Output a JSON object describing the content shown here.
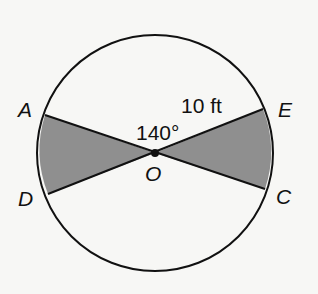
{
  "diagram": {
    "center_label": "O",
    "angle_label": "140°",
    "radius_label": "10 ft",
    "points": {
      "A": "A",
      "E": "E",
      "D": "D",
      "C": "C"
    },
    "colors": {
      "background": "#f7f7f5",
      "stroke": "#111111",
      "shaded": "#8f8f8f"
    }
  }
}
